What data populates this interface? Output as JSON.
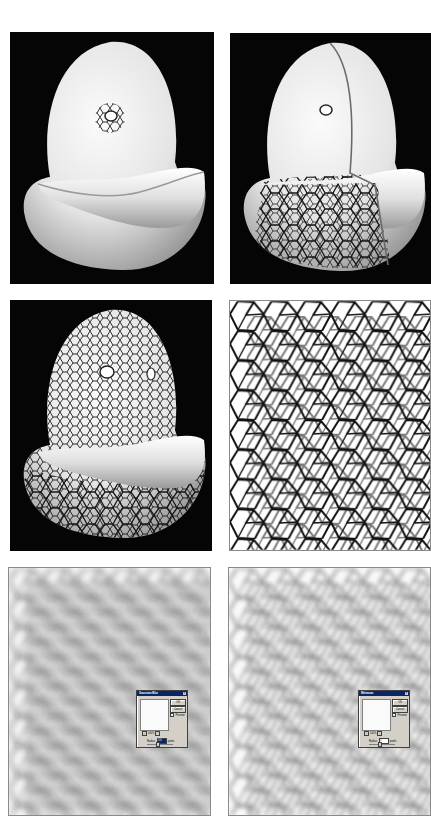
{
  "figure": {
    "layout": "3 rows x 2 columns of illustration panels",
    "panels": [
      {
        "id": "p1",
        "description": "Smooth white 3D bean/egg shaped model on black background with a small cracked-cell patch around a hole"
      },
      {
        "id": "p2",
        "description": "Same model with cracked cell texture spreading over the front half, seam line visible"
      },
      {
        "id": "p3",
        "description": "Model fully covered in cracked cell texture on black background"
      },
      {
        "id": "p4",
        "description": "Flat black-on-white cell / crackle texture map"
      },
      {
        "id": "p5",
        "description": "Blurred cell texture with Gaussian Blur dialog"
      },
      {
        "id": "p6",
        "description": "Blurred cell texture after Minimum filter with Minimum dialog"
      }
    ]
  },
  "dialogs": {
    "gaussian_blur": {
      "title": "Gaussian Blur",
      "close": "×",
      "ok_label": "OK",
      "cancel_label": "Cancel",
      "preview_label": "Preview",
      "preview_checked": "✓",
      "zoom_minus": "−",
      "zoom_value": "100%",
      "zoom_plus": "+",
      "radius_label": "Radius:",
      "radius_value": "3.0",
      "radius_unit": "pixels"
    },
    "minimum": {
      "title": "Minimum",
      "close": "×",
      "ok_label": "OK",
      "cancel_label": "Cancel",
      "preview_label": "Preview",
      "preview_checked": "✓",
      "zoom_minus": "−",
      "zoom_value": "100%",
      "zoom_plus": "+",
      "radius_label": "Radius:",
      "radius_value": "1",
      "radius_unit": "pixels"
    }
  },
  "colors": {
    "background": "#ffffff",
    "render_background": "#050505",
    "model_highlight": "#f4f4f4",
    "model_shadow": "#8c8c8c",
    "crack_line": "#1a1a1a",
    "dialog_face": "#d4d0c8",
    "dialog_titlebar": "#0a246a"
  }
}
